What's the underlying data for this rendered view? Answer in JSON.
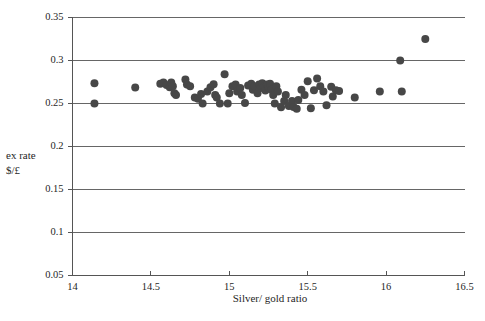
{
  "chart_data": {
    "type": "scatter",
    "title": "",
    "xlabel": "Silver/ gold ratio",
    "ylabel": "ex rate $/£",
    "ylabel_lines": [
      "ex rate",
      "$/£"
    ],
    "xlim": [
      14,
      16.5
    ],
    "ylim": [
      0.05,
      0.35
    ],
    "xticks": [
      "14",
      "14.5",
      "15",
      "15.5",
      "16",
      "16.5"
    ],
    "xtick_values": [
      14,
      14.5,
      15,
      15.5,
      16,
      16.5
    ],
    "yticks": [
      "0.35",
      "0.3",
      "0.25",
      "0.2",
      "0.15",
      "0.1",
      "0.05"
    ],
    "ytick_values": [
      0.35,
      0.3,
      0.25,
      0.2,
      0.15,
      0.1,
      0.05
    ],
    "grid": "horizontal",
    "legend": "none",
    "marker": "filled-circle",
    "marker_color": "#474747",
    "marker_size": 7,
    "axis_color": "#555555",
    "grid_color": "#666666",
    "points": [
      [
        14.14,
        0.2735
      ],
      [
        14.14,
        0.25
      ],
      [
        14.4,
        0.2685
      ],
      [
        14.56,
        0.273
      ],
      [
        14.58,
        0.2745
      ],
      [
        14.6,
        0.2715
      ],
      [
        14.62,
        0.269
      ],
      [
        14.63,
        0.2745
      ],
      [
        14.64,
        0.27
      ],
      [
        14.65,
        0.262
      ],
      [
        14.66,
        0.26
      ],
      [
        14.72,
        0.278
      ],
      [
        14.73,
        0.272
      ],
      [
        14.75,
        0.27
      ],
      [
        14.78,
        0.257
      ],
      [
        14.8,
        0.2555
      ],
      [
        14.82,
        0.261
      ],
      [
        14.83,
        0.25
      ],
      [
        14.86,
        0.264
      ],
      [
        14.88,
        0.269
      ],
      [
        14.9,
        0.2725
      ],
      [
        14.91,
        0.26
      ],
      [
        14.92,
        0.257
      ],
      [
        14.94,
        0.25
      ],
      [
        14.97,
        0.284
      ],
      [
        14.99,
        0.25
      ],
      [
        15.0,
        0.262
      ],
      [
        15.02,
        0.27
      ],
      [
        15.04,
        0.272
      ],
      [
        15.05,
        0.264
      ],
      [
        15.07,
        0.268
      ],
      [
        15.08,
        0.26
      ],
      [
        15.1,
        0.2505
      ],
      [
        15.12,
        0.271
      ],
      [
        15.14,
        0.273
      ],
      [
        15.15,
        0.266
      ],
      [
        15.16,
        0.27
      ],
      [
        15.18,
        0.262
      ],
      [
        15.19,
        0.272
      ],
      [
        15.2,
        0.268
      ],
      [
        15.21,
        0.2735
      ],
      [
        15.22,
        0.27
      ],
      [
        15.23,
        0.265
      ],
      [
        15.24,
        0.272
      ],
      [
        15.25,
        0.269
      ],
      [
        15.26,
        0.273
      ],
      [
        15.27,
        0.266
      ],
      [
        15.28,
        0.26
      ],
      [
        15.29,
        0.25
      ],
      [
        15.3,
        0.27
      ],
      [
        15.31,
        0.264
      ],
      [
        15.33,
        0.2455
      ],
      [
        15.35,
        0.253
      ],
      [
        15.36,
        0.26
      ],
      [
        15.38,
        0.247
      ],
      [
        15.4,
        0.253
      ],
      [
        15.41,
        0.246
      ],
      [
        15.43,
        0.244
      ],
      [
        15.44,
        0.254
      ],
      [
        15.46,
        0.266
      ],
      [
        15.48,
        0.26
      ],
      [
        15.5,
        0.276
      ],
      [
        15.52,
        0.2445
      ],
      [
        15.54,
        0.2655
      ],
      [
        15.56,
        0.279
      ],
      [
        15.58,
        0.27
      ],
      [
        15.6,
        0.264
      ],
      [
        15.62,
        0.248
      ],
      [
        15.65,
        0.2695
      ],
      [
        15.66,
        0.258
      ],
      [
        15.68,
        0.2655
      ],
      [
        15.7,
        0.2645
      ],
      [
        15.8,
        0.257
      ],
      [
        15.96,
        0.264
      ],
      [
        16.09,
        0.3
      ],
      [
        16.1,
        0.264
      ],
      [
        16.25,
        0.325
      ]
    ]
  }
}
